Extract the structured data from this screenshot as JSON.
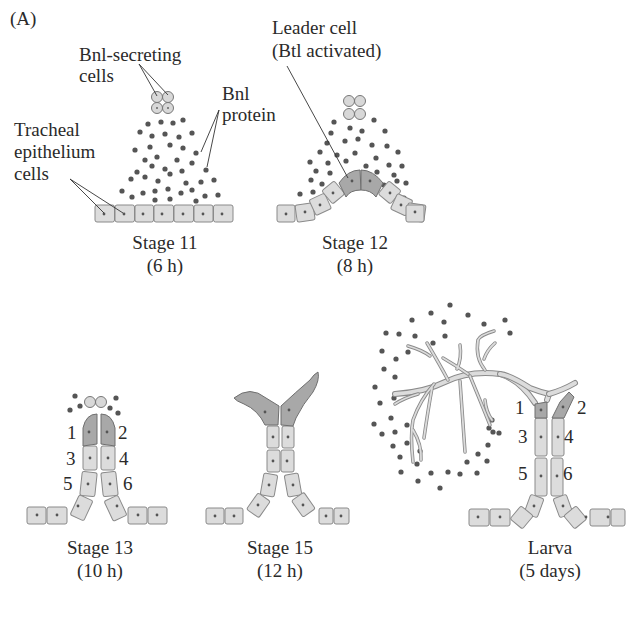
{
  "figure": {
    "panel_label": "(A)",
    "colors": {
      "cell_fill": "#dcdcdc",
      "cell_stroke": "#8a8a8a",
      "leader_fill": "#a8a8a8",
      "dot": "#555555",
      "line": "#333333"
    }
  },
  "annotations": {
    "bnl_secreting": [
      "Bnl-secreting",
      "cells"
    ],
    "bnl_protein": [
      "Bnl",
      "protein"
    ],
    "tracheal": [
      "Tracheal",
      "epithelium",
      "cells"
    ],
    "leader": [
      "Leader cell",
      "(Btl activated)"
    ]
  },
  "stages": [
    {
      "name": "Stage 11",
      "time": "(6 h)"
    },
    {
      "name": "Stage 12",
      "time": "(8 h)"
    },
    {
      "name": "Stage 13",
      "time": "(10 h)"
    },
    {
      "name": "Stage 15",
      "time": "(12 h)"
    },
    {
      "name": "Larva",
      "time": "(5 days)"
    }
  ],
  "cell_numbers": {
    "stage13": [
      "1",
      "2",
      "3",
      "4",
      "5",
      "6"
    ],
    "larva": [
      "1",
      "2",
      "3",
      "4",
      "5",
      "6"
    ]
  }
}
